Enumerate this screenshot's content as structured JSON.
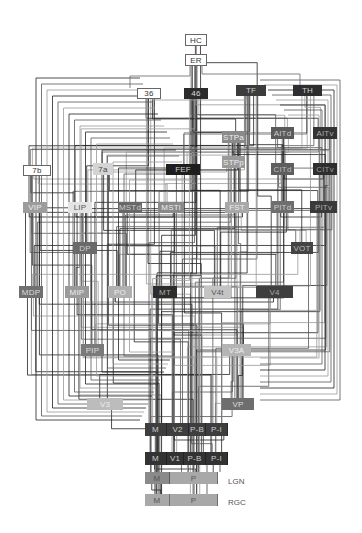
{
  "diagram": {
    "nodes": [
      {
        "id": "HC",
        "label": "HC",
        "x": 185,
        "y": 34,
        "w": 22,
        "h": 12,
        "fill": "#ffffff",
        "text": "#333",
        "border": "#666"
      },
      {
        "id": "ER",
        "label": "ER",
        "x": 185,
        "y": 54,
        "w": 22,
        "h": 12,
        "fill": "#ffffff",
        "text": "#333",
        "border": "#666"
      },
      {
        "id": "36",
        "label": "36",
        "x": 137,
        "y": 88,
        "w": 24,
        "h": 11,
        "fill": "#ffffff",
        "text": "#333",
        "border": "#666"
      },
      {
        "id": "46",
        "label": "46",
        "x": 184,
        "y": 88,
        "w": 24,
        "h": 11,
        "fill": "#2b2b2b",
        "text": "#ddd"
      },
      {
        "id": "TF",
        "label": "TF",
        "x": 236,
        "y": 85,
        "w": 30,
        "h": 11,
        "fill": "#3c3c3c",
        "text": "#ccc"
      },
      {
        "id": "TH",
        "label": "TH",
        "x": 293,
        "y": 85,
        "w": 29,
        "h": 11,
        "fill": "#2e2e2e",
        "text": "#ccc"
      },
      {
        "id": "STPa",
        "label": "STPa",
        "x": 222,
        "y": 131,
        "w": 23,
        "h": 12,
        "fill": "#8a8a8a",
        "text": "#eee"
      },
      {
        "id": "AITd",
        "label": "AITd",
        "x": 271,
        "y": 127,
        "w": 23,
        "h": 12,
        "fill": "#5a5a5a",
        "text": "#ccc"
      },
      {
        "id": "AITv",
        "label": "AITv",
        "x": 313,
        "y": 127,
        "w": 24,
        "h": 12,
        "fill": "#333333",
        "text": "#aaa"
      },
      {
        "id": "STPp",
        "label": "STPp",
        "x": 222,
        "y": 156,
        "w": 23,
        "h": 12,
        "fill": "#9a9a9a",
        "text": "#eee"
      },
      {
        "id": "CITd",
        "label": "CITd",
        "x": 271,
        "y": 163,
        "w": 23,
        "h": 12,
        "fill": "#5e5e5e",
        "text": "#bbb"
      },
      {
        "id": "CITv",
        "label": "CITv",
        "x": 313,
        "y": 163,
        "w": 24,
        "h": 12,
        "fill": "#2e2e2e",
        "text": "#999"
      },
      {
        "id": "7b",
        "label": "7b",
        "x": 23,
        "y": 165,
        "w": 28,
        "h": 11,
        "fill": "#ffffff",
        "text": "#333",
        "border": "#666"
      },
      {
        "id": "7a",
        "label": "7a",
        "x": 93,
        "y": 163,
        "w": 20,
        "h": 12,
        "fill": "#d4d4d4",
        "text": "#444"
      },
      {
        "id": "FEF",
        "label": "FEF",
        "x": 166,
        "y": 164,
        "w": 34,
        "h": 11,
        "fill": "#1e1e1e",
        "text": "#ccc"
      },
      {
        "id": "VIP",
        "label": "VIP",
        "x": 23,
        "y": 202,
        "w": 24,
        "h": 11,
        "fill": "#9c9c9c",
        "text": "#eee"
      },
      {
        "id": "LIP",
        "label": "LIP",
        "x": 68,
        "y": 202,
        "w": 24,
        "h": 11,
        "fill": "#e4e4e4",
        "text": "#555"
      },
      {
        "id": "MSTd",
        "label": "MSTd",
        "x": 118,
        "y": 202,
        "w": 24,
        "h": 11,
        "fill": "#686868",
        "text": "#ccc"
      },
      {
        "id": "MSTl",
        "label": "MSTl",
        "x": 158,
        "y": 202,
        "w": 26,
        "h": 11,
        "fill": "#8a8a8a",
        "text": "#eee"
      },
      {
        "id": "FST",
        "label": "FST",
        "x": 225,
        "y": 202,
        "w": 24,
        "h": 11,
        "fill": "#a8a8a8",
        "text": "#eee"
      },
      {
        "id": "PITd",
        "label": "PITd",
        "x": 271,
        "y": 201,
        "w": 23,
        "h": 12,
        "fill": "#6e6e6e",
        "text": "#ccc"
      },
      {
        "id": "PITv",
        "label": "PITv",
        "x": 310,
        "y": 201,
        "w": 27,
        "h": 12,
        "fill": "#3a3a3a",
        "text": "#aaa"
      },
      {
        "id": "DP",
        "label": "DP",
        "x": 73,
        "y": 242,
        "w": 24,
        "h": 12,
        "fill": "#6a6a6a",
        "text": "#ccc"
      },
      {
        "id": "VOT",
        "label": "VOT",
        "x": 291,
        "y": 242,
        "w": 22,
        "h": 12,
        "fill": "#444444",
        "text": "#bbb"
      },
      {
        "id": "MDP",
        "label": "MDP",
        "x": 19,
        "y": 286,
        "w": 24,
        "h": 12,
        "fill": "#707070",
        "text": "#ddd"
      },
      {
        "id": "MIP",
        "label": "MIP",
        "x": 65,
        "y": 286,
        "w": 24,
        "h": 12,
        "fill": "#9a9a9a",
        "text": "#eee"
      },
      {
        "id": "PO",
        "label": "PO",
        "x": 108,
        "y": 286,
        "w": 24,
        "h": 12,
        "fill": "#b0b0b0",
        "text": "#eee"
      },
      {
        "id": "MT",
        "label": "MT",
        "x": 153,
        "y": 286,
        "w": 24,
        "h": 12,
        "fill": "#2c2c2c",
        "text": "#aaa"
      },
      {
        "id": "V4t",
        "label": "V4t",
        "x": 204,
        "y": 286,
        "w": 27,
        "h": 12,
        "fill": "#c4c4c4",
        "text": "#555"
      },
      {
        "id": "V4",
        "label": "V4",
        "x": 256,
        "y": 286,
        "w": 37,
        "h": 12,
        "fill": "#3e3e3e",
        "text": "#aaa"
      },
      {
        "id": "PIP",
        "label": "PIP",
        "x": 81,
        "y": 344,
        "w": 23,
        "h": 12,
        "fill": "#7a7a7a",
        "text": "#ddd"
      },
      {
        "id": "V3A",
        "label": "V3A",
        "x": 222,
        "y": 344,
        "w": 29,
        "h": 12,
        "fill": "#b4b4b4",
        "text": "#eee"
      },
      {
        "id": "V3",
        "label": "V3",
        "x": 87,
        "y": 398,
        "w": 36,
        "h": 12,
        "fill": "#bcbcbc",
        "text": "#eee"
      },
      {
        "id": "VP",
        "label": "VP",
        "x": 222,
        "y": 398,
        "w": 32,
        "h": 12,
        "fill": "#6e6e6e",
        "text": "#ddd"
      }
    ],
    "compound_nodes": [
      {
        "id": "V2",
        "x": 145,
        "y": 423,
        "h": 13,
        "fill": "#3e3e3e",
        "text": "#ccc",
        "cells": [
          {
            "label": "M",
            "w": 22
          },
          {
            "label": "V2",
            "w": 22
          },
          {
            "label": "P-B",
            "w": 17
          },
          {
            "label": "P-I",
            "w": 22
          }
        ]
      },
      {
        "id": "V1",
        "x": 145,
        "y": 452,
        "h": 13,
        "fill": "#333333",
        "text": "#ccc",
        "cells": [
          {
            "label": "M",
            "w": 22
          },
          {
            "label": "V1",
            "w": 17
          },
          {
            "label": "P-B",
            "w": 22
          },
          {
            "label": "P-I",
            "w": 22
          }
        ]
      },
      {
        "id": "LGN",
        "x": 145,
        "y": 472,
        "h": 12,
        "fill": "#a8a8a8",
        "text": "#555",
        "cells": [
          {
            "label": "M",
            "w": 25,
            "fill": "#8a8a8a"
          },
          {
            "label": "P",
            "w": 48
          }
        ]
      },
      {
        "id": "RGC",
        "x": 145,
        "y": 494,
        "h": 12,
        "fill": "#a8a8a8",
        "text": "#555",
        "cells": [
          {
            "label": "M",
            "w": 25
          },
          {
            "label": "P",
            "w": 48
          }
        ]
      }
    ],
    "side_labels": [
      {
        "label": "LGN",
        "x": 228,
        "y": 477
      },
      {
        "label": "RGC",
        "x": 228,
        "y": 498
      }
    ],
    "wire_colors": {
      "dark": "#222222",
      "mid": "#555555",
      "light": "#999999"
    }
  }
}
